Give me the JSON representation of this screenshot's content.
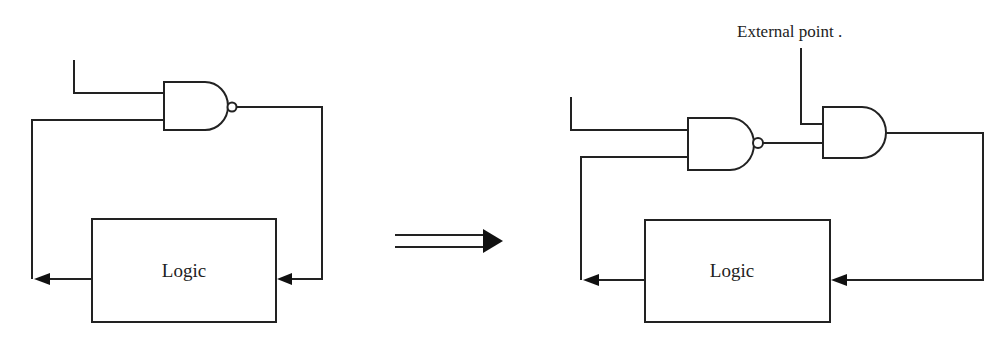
{
  "diagram": {
    "type": "circuit-transformation",
    "colors": {
      "line": "#222222",
      "background": "#ffffff"
    },
    "before": {
      "logic_block": {
        "label": "Logic"
      },
      "gates": [
        {
          "type": "NAND",
          "inputs": 2
        }
      ]
    },
    "transform_arrow": {
      "icon": "double-arrow-right-icon"
    },
    "after": {
      "logic_block": {
        "label": "Logic"
      },
      "external_point_label": "External point  .",
      "gates": [
        {
          "type": "NAND",
          "inputs": 2
        },
        {
          "type": "AND",
          "inputs": 2
        }
      ]
    }
  }
}
